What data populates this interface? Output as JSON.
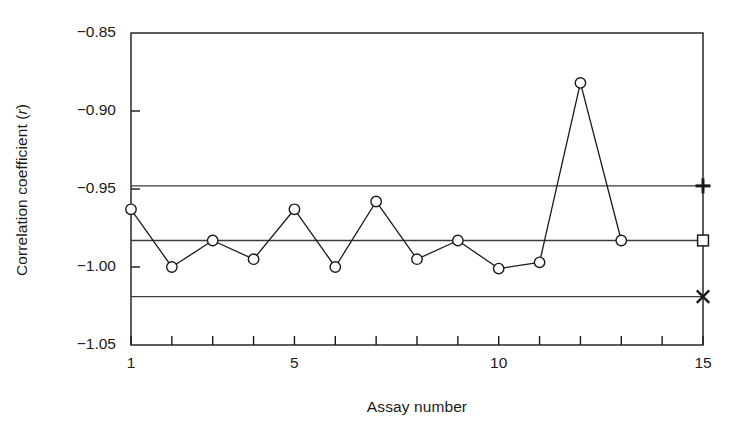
{
  "chart_data": {
    "type": "line",
    "title": "",
    "xlabel": "Assay number",
    "ylabel_text": "Correlation coefficient (",
    "ylabel_italic": "r",
    "ylabel_tail": ")",
    "ylabel_full": "Correlation coefficient (r)",
    "x": [
      1,
      2,
      3,
      4,
      5,
      6,
      7,
      8,
      9,
      10,
      11,
      12,
      13
    ],
    "values": [
      -0.963,
      -1.0,
      -0.983,
      -0.995,
      -0.963,
      -1.0,
      -0.958,
      -0.995,
      -0.983,
      -1.001,
      -0.997,
      -0.882,
      -0.983
    ],
    "series": [
      {
        "name": "Correlation coefficient (r)",
        "marker": "circle",
        "values": [
          -0.963,
          -1.0,
          -0.983,
          -0.995,
          -0.963,
          -1.0,
          -0.958,
          -0.995,
          -0.983,
          -1.001,
          -0.997,
          -0.882,
          -0.983
        ]
      }
    ],
    "xlim": [
      1,
      15
    ],
    "ylim": [
      -1.05,
      -0.85
    ],
    "yticks": [
      -0.85,
      -0.9,
      -0.95,
      -1.0,
      -1.05
    ],
    "ytick_labels": [
      "−0.85",
      "−0.90",
      "−0.95",
      "−1.00",
      "−1.05"
    ],
    "xticks": [
      1,
      2,
      3,
      4,
      5,
      6,
      7,
      8,
      9,
      10,
      11,
      12,
      13,
      14,
      15
    ],
    "xtick_labels_shown": [
      {
        "x": 1,
        "label": "1"
      },
      {
        "x": 5,
        "label": "5"
      },
      {
        "x": 10,
        "label": "10"
      },
      {
        "x": 15,
        "label": "15"
      }
    ],
    "grid": false,
    "legend": "none",
    "reference_lines": [
      {
        "name": "upper-control-limit",
        "value": -0.948,
        "end_marker": "plus"
      },
      {
        "name": "mean-line",
        "value": -0.983,
        "end_marker": "square"
      },
      {
        "name": "lower-control-limit",
        "value": -1.019,
        "end_marker": "cross"
      }
    ],
    "colors": {
      "line": "#1a1a1a",
      "marker_stroke": "#1a1a1a",
      "marker_fill": "#ffffff",
      "axis": "#1a1a1a",
      "reference_line": "#3a3a3a",
      "background": "#ffffff"
    }
  }
}
